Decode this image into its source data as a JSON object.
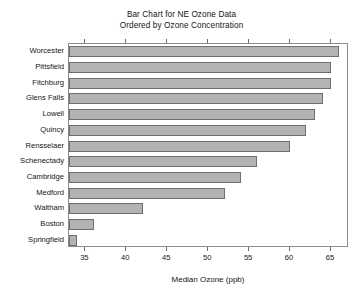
{
  "chart_data": {
    "type": "bar",
    "orientation": "horizontal",
    "title": "Bar Chart for NE Ozone Data\nOrdered by Ozone Concentration",
    "title_lines": [
      "Bar Chart for NE Ozone Data",
      "Ordered by Ozone Concentration"
    ],
    "xlabel": "Median Ozone (ppb)",
    "ylabel": "",
    "categories": [
      "Worcester",
      "Pittsfield",
      "Fitchburg",
      "Glens Falls",
      "Lowell",
      "Quincy",
      "Rensselaer",
      "Schenectady",
      "Cambridge",
      "Medford",
      "Waltham",
      "Boston",
      "Springfield"
    ],
    "values": [
      66,
      65,
      65,
      64,
      63,
      62,
      60,
      56,
      54,
      52,
      42,
      36,
      34
    ],
    "xlim": [
      33,
      67.2
    ],
    "xticks": [
      35,
      40,
      45,
      50,
      55,
      60,
      65
    ],
    "xtick_labels": [
      "35",
      "40",
      "45",
      "50",
      "55",
      "60",
      "65"
    ],
    "grid": false,
    "legend": false,
    "bar_color": "#b3b3b3",
    "bar_edge_color": "#6e6e6e",
    "frame_color": "#8c8c8c",
    "background_color": "#ffffff"
  }
}
